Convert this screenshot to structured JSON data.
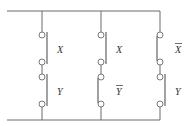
{
  "diagram": {
    "type": "switching-circuit",
    "colors": {
      "wire": "#6b6b6b",
      "label": "#333333"
    },
    "branches": [
      {
        "name": "branch-1",
        "switches": [
          {
            "variable": "X",
            "complemented": false,
            "blade_side": "right"
          },
          {
            "variable": "Y",
            "complemented": false,
            "blade_side": "right"
          }
        ]
      },
      {
        "name": "branch-2",
        "switches": [
          {
            "variable": "X",
            "complemented": false,
            "blade_side": "right"
          },
          {
            "variable": "Y",
            "complemented": true,
            "blade_side": "left"
          }
        ]
      },
      {
        "name": "branch-3",
        "switches": [
          {
            "variable": "X",
            "complemented": true,
            "blade_side": "left"
          },
          {
            "variable": "Y",
            "complemented": false,
            "blade_side": "right"
          }
        ]
      }
    ]
  }
}
